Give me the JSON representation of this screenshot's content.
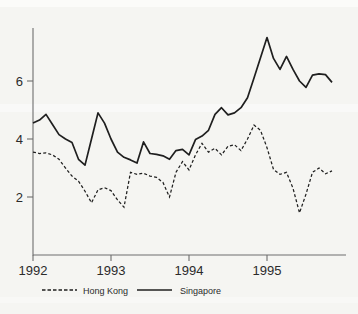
{
  "chart_data": {
    "type": "line",
    "title": "",
    "xlabel": "",
    "ylabel": "",
    "x_start_year": 1992,
    "points_per_year": 12,
    "x_tick_labels": [
      "1992",
      "1993",
      "1994",
      "1995"
    ],
    "y_tick_labels": [
      "2",
      "4",
      "6"
    ],
    "y_ticks": [
      2,
      4,
      6
    ],
    "ylim": [
      0,
      7.8
    ],
    "grid": "off",
    "legend_position": "bottom",
    "series": [
      {
        "name": "Hong Kong",
        "style": "dashed",
        "values": [
          3.55,
          3.5,
          3.52,
          3.45,
          3.3,
          3.0,
          2.72,
          2.55,
          2.2,
          1.8,
          2.25,
          2.32,
          2.22,
          1.9,
          1.65,
          2.85,
          2.78,
          2.82,
          2.72,
          2.68,
          2.5,
          2.0,
          2.85,
          3.22,
          2.93,
          3.45,
          3.85,
          3.55,
          3.68,
          3.45,
          3.75,
          3.8,
          3.6,
          4.0,
          4.48,
          4.3,
          3.7,
          2.95,
          2.78,
          2.85,
          2.3,
          1.45,
          2.1,
          2.85,
          3.0,
          2.8,
          2.9
        ]
      },
      {
        "name": "Singapore",
        "style": "solid",
        "values": [
          4.55,
          4.65,
          4.85,
          4.5,
          4.15,
          4.0,
          3.88,
          3.3,
          3.1,
          4.0,
          4.9,
          4.55,
          4.0,
          3.55,
          3.37,
          3.28,
          3.17,
          3.9,
          3.5,
          3.47,
          3.42,
          3.3,
          3.6,
          3.64,
          3.45,
          3.98,
          4.1,
          4.3,
          4.85,
          5.08,
          4.83,
          4.9,
          5.08,
          5.42,
          6.1,
          6.8,
          7.5,
          6.78,
          6.4,
          6.85,
          6.4,
          6.0,
          5.78,
          6.2,
          6.25,
          6.22,
          5.95
        ]
      }
    ]
  },
  "axis": {
    "x_tick_labels": [
      "1992",
      "1993",
      "1994",
      "1995"
    ],
    "y_tick_labels": [
      "6",
      "4",
      "2"
    ]
  },
  "legend": {
    "items": [
      {
        "label": "Hong Kong"
      },
      {
        "label": "Singapore"
      }
    ]
  },
  "colors": {
    "line": "#1f1f1f",
    "axis": "#6e6e6e",
    "text": "#2b2b2b",
    "background": "#f5f5f2"
  }
}
